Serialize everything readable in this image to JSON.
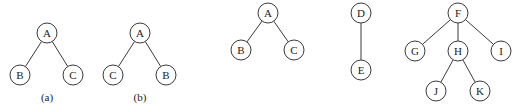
{
  "node_radius": 10,
  "trees": [
    {
      "id": "tree-a",
      "caption": "(a)",
      "caption_pos": [
        47,
        101
      ],
      "nodes": [
        {
          "label": "A",
          "x": 47,
          "y": 33
        },
        {
          "label": "B",
          "x": 20,
          "y": 75
        },
        {
          "label": "C",
          "x": 73,
          "y": 75
        }
      ],
      "edges": [
        [
          0,
          1
        ],
        [
          0,
          2
        ]
      ]
    },
    {
      "id": "tree-b",
      "caption": "(b)",
      "caption_pos": [
        140,
        101
      ],
      "nodes": [
        {
          "label": "A",
          "x": 140,
          "y": 33
        },
        {
          "label": "C",
          "x": 113,
          "y": 75
        },
        {
          "label": "B",
          "x": 166,
          "y": 75
        }
      ],
      "edges": [
        [
          0,
          1
        ],
        [
          0,
          2
        ]
      ]
    },
    {
      "id": "tree-abc",
      "caption": "",
      "nodes": [
        {
          "label": "A",
          "x": 268,
          "y": 13
        },
        {
          "label": "B",
          "x": 241,
          "y": 50
        },
        {
          "label": "C",
          "x": 294,
          "y": 50
        }
      ],
      "edges": [
        [
          0,
          1
        ],
        [
          0,
          2
        ]
      ]
    },
    {
      "id": "tree-de",
      "caption": "",
      "nodes": [
        {
          "label": "D",
          "x": 361,
          "y": 13
        },
        {
          "label": "E",
          "x": 361,
          "y": 70
        }
      ],
      "edges": [
        [
          0,
          1
        ]
      ]
    },
    {
      "id": "tree-f",
      "caption": "",
      "nodes": [
        {
          "label": "F",
          "x": 458,
          "y": 13
        },
        {
          "label": "G",
          "x": 415,
          "y": 51
        },
        {
          "label": "H",
          "x": 458,
          "y": 51
        },
        {
          "label": "I",
          "x": 501,
          "y": 51
        },
        {
          "label": "J",
          "x": 436,
          "y": 91
        },
        {
          "label": "K",
          "x": 480,
          "y": 91
        }
      ],
      "edges": [
        [
          0,
          1
        ],
        [
          0,
          2
        ],
        [
          0,
          3
        ],
        [
          2,
          4
        ],
        [
          2,
          5
        ]
      ]
    }
  ]
}
